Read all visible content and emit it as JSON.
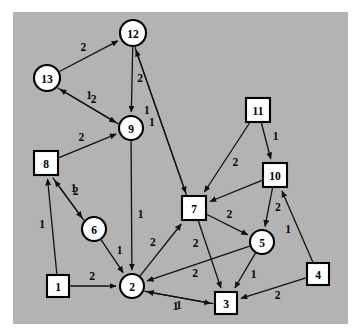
{
  "figure": {
    "title": "",
    "background_color": "#ffffff",
    "plot_background_color": "#b3b3b3",
    "plot_rect": {
      "x": 13,
      "y": 12,
      "width": 335,
      "height": 312
    },
    "node_fill": "#ffffff",
    "node_stroke": "#000000",
    "edge_color": "#111111"
  },
  "chart_data": {
    "type": "diagram",
    "graph_type": "directed-weighted-graph",
    "title": "",
    "xlabel": "",
    "ylabel": "",
    "node_count": 13,
    "edge_count": 25,
    "weights_present": [
      1,
      2
    ],
    "nodes": [
      {
        "id": "1",
        "label": "1",
        "shape": "square",
        "x": 58,
        "y": 286,
        "r": 11
      },
      {
        "id": "2",
        "label": "2",
        "shape": "circle",
        "x": 132,
        "y": 286,
        "r": 12
      },
      {
        "id": "3",
        "label": "3",
        "shape": "square",
        "x": 226,
        "y": 303,
        "r": 11
      },
      {
        "id": "4",
        "label": "4",
        "shape": "square",
        "x": 318,
        "y": 274,
        "r": 11
      },
      {
        "id": "5",
        "label": "5",
        "shape": "circle",
        "x": 262,
        "y": 242,
        "r": 12
      },
      {
        "id": "6",
        "label": "6",
        "shape": "circle",
        "x": 94,
        "y": 229,
        "r": 12
      },
      {
        "id": "7",
        "label": "7",
        "shape": "square",
        "x": 194,
        "y": 208,
        "r": 12
      },
      {
        "id": "8",
        "label": "8",
        "shape": "square",
        "x": 46,
        "y": 163,
        "r": 12
      },
      {
        "id": "9",
        "label": "9",
        "shape": "circle",
        "x": 131,
        "y": 128,
        "r": 12
      },
      {
        "id": "10",
        "label": "10",
        "shape": "square",
        "x": 275,
        "y": 175,
        "r": 12
      },
      {
        "id": "11",
        "label": "11",
        "shape": "square",
        "x": 258,
        "y": 110,
        "r": 12
      },
      {
        "id": "12",
        "label": "12",
        "shape": "circle",
        "x": 133,
        "y": 33,
        "r": 13
      },
      {
        "id": "13",
        "label": "13",
        "shape": "circle",
        "x": 47,
        "y": 78,
        "r": 13
      }
    ],
    "edges": [
      {
        "source": "13",
        "target": "12",
        "weight": "2",
        "directed": true,
        "offset": 0,
        "label_t": 0.48,
        "label_off": -9
      },
      {
        "source": "12",
        "target": "9",
        "weight": "2",
        "directed": true,
        "offset": 0,
        "label_t": 0.5,
        "label_off": -8
      },
      {
        "source": "12",
        "target": "7",
        "weight": "1",
        "directed": true,
        "offset": 2.6,
        "label_t": 0.42,
        "label_off": 10
      },
      {
        "source": "7",
        "target": "12",
        "weight": "1",
        "directed": true,
        "offset": -2.6,
        "label_t": 0.52,
        "label_off": -9
      },
      {
        "source": "13",
        "target": "9",
        "weight": "2",
        "directed": true,
        "offset": 2.6,
        "label_t": 0.55,
        "label_off": -8
      },
      {
        "source": "9",
        "target": "13",
        "weight": "1",
        "directed": true,
        "offset": -2.6,
        "label_t": 0.58,
        "label_off": 9
      },
      {
        "source": "9",
        "target": "2",
        "weight": "1",
        "directed": true,
        "offset": 0,
        "label_t": 0.58,
        "label_off": -9
      },
      {
        "source": "8",
        "target": "9",
        "weight": "2",
        "directed": true,
        "offset": 0,
        "label_t": 0.45,
        "label_off": -9
      },
      {
        "source": "8",
        "target": "6",
        "weight": "1",
        "directed": true,
        "offset": 2.6,
        "label_t": 0.44,
        "label_off": -10
      },
      {
        "source": "6",
        "target": "8",
        "weight": "2",
        "directed": true,
        "offset": -2.6,
        "label_t": 0.56,
        "label_off": 10
      },
      {
        "source": "1",
        "target": "8",
        "weight": "1",
        "directed": true,
        "offset": 0,
        "label_t": 0.52,
        "label_off": -10
      },
      {
        "source": "1",
        "target": "2",
        "weight": "2",
        "directed": true,
        "offset": 0,
        "label_t": 0.48,
        "label_off": -9
      },
      {
        "source": "6",
        "target": "2",
        "weight": "1",
        "directed": true,
        "offset": 0,
        "label_t": 0.5,
        "label_off": -9
      },
      {
        "source": "2",
        "target": "7",
        "weight": "2",
        "directed": true,
        "offset": 0,
        "label_t": 0.5,
        "label_off": -10
      },
      {
        "source": "11",
        "target": "7",
        "weight": "2",
        "directed": true,
        "offset": 0,
        "label_t": 0.5,
        "label_off": -10
      },
      {
        "source": "11",
        "target": "10",
        "weight": "1",
        "directed": true,
        "offset": 0,
        "label_t": 0.48,
        "label_off": -10
      },
      {
        "source": "10",
        "target": "7",
        "weight": "1",
        "directed": true,
        "offset": 0,
        "label_t": 0.5,
        "label_off": 0,
        "hide_label": true
      },
      {
        "source": "10",
        "target": "5",
        "weight": "2",
        "directed": true,
        "offset": 0,
        "label_t": 0.48,
        "label_off": -9
      },
      {
        "source": "4",
        "target": "10",
        "weight": "1",
        "directed": true,
        "offset": 0,
        "label_t": 0.5,
        "label_off": -10
      },
      {
        "source": "7",
        "target": "5",
        "weight": "2",
        "directed": true,
        "offset": 0,
        "label_t": 0.45,
        "label_off": -9
      },
      {
        "source": "7",
        "target": "3",
        "weight": "2",
        "directed": true,
        "offset": 0,
        "label_t": 0.3,
        "label_off": 10
      },
      {
        "source": "5",
        "target": "2",
        "weight": "2",
        "directed": true,
        "offset": 0,
        "label_t": 0.56,
        "label_off": -9
      },
      {
        "source": "5",
        "target": "3",
        "weight": "1",
        "directed": true,
        "offset": 0,
        "label_t": 0.5,
        "label_off": -10
      },
      {
        "source": "4",
        "target": "3",
        "weight": "2",
        "directed": true,
        "offset": 0,
        "label_t": 0.48,
        "label_off": -9
      },
      {
        "source": "3",
        "target": "2",
        "weight": "1",
        "directed": true,
        "offset": -2.6,
        "label_t": 0.5,
        "label_off": -9
      },
      {
        "source": "2",
        "target": "3",
        "weight": "1",
        "directed": true,
        "offset": 2.6,
        "label_t": 0.5,
        "label_off": 10
      }
    ]
  }
}
